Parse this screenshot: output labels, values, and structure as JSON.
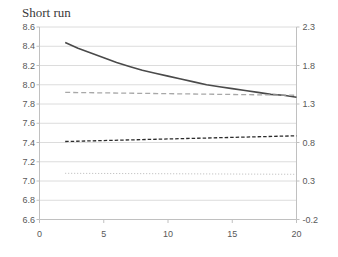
{
  "title": "Short run",
  "chart_data": {
    "type": "line",
    "title": "Short run",
    "legend": "none",
    "grid": "horizontal-only",
    "x_axis": {
      "min": 0,
      "max": 20,
      "ticks": [
        "0",
        "5",
        "10",
        "15",
        "20"
      ]
    },
    "left_axis": {
      "min": 6.6,
      "max": 8.6,
      "step": 0.2,
      "ticks": [
        "8.6",
        "8.4",
        "8.2",
        "8.0",
        "7.8",
        "7.6",
        "7.4",
        "7.2",
        "7.0",
        "6.8",
        "6.6"
      ]
    },
    "right_axis": {
      "min": -0.2,
      "max": 2.3,
      "step": 0.5,
      "ticks": [
        "2.3",
        "1.8",
        "1.3",
        "0.8",
        "0.3",
        "-0.2"
      ]
    },
    "colors": {
      "grid": "#dcdcdc",
      "axis": "#c0c0c0",
      "tick_label": "#595959",
      "title": "#3a3a3a"
    },
    "series": [
      {
        "name": "solid-declining-curve",
        "style": "solid",
        "color": "#4a4a4a",
        "width": 1.6,
        "dash": "",
        "x": [
          2,
          3,
          4,
          5,
          6,
          7,
          8,
          9,
          10,
          11,
          12,
          13,
          14,
          15,
          16,
          17,
          18,
          19,
          20
        ],
        "y": [
          8.44,
          8.38,
          8.33,
          8.28,
          8.23,
          8.19,
          8.15,
          8.12,
          8.09,
          8.06,
          8.03,
          8.0,
          7.98,
          7.96,
          7.94,
          7.92,
          7.9,
          7.89,
          7.87
        ]
      },
      {
        "name": "gray-long-dashed-line",
        "style": "dashed",
        "color": "#a8a8a8",
        "width": 1.3,
        "dash": "5 3",
        "x": [
          2,
          20
        ],
        "y": [
          7.92,
          7.89
        ]
      },
      {
        "name": "dark-short-dashed-line",
        "style": "dashed",
        "color": "#2b2b2b",
        "width": 1.3,
        "dash": "3.5 2",
        "x": [
          2,
          20
        ],
        "y": [
          7.41,
          7.47
        ]
      },
      {
        "name": "light-dotted-line",
        "style": "dotted",
        "color": "#b8b8b8",
        "width": 1,
        "dash": "1 2",
        "x": [
          2,
          20
        ],
        "y": [
          7.08,
          7.07
        ]
      }
    ]
  }
}
